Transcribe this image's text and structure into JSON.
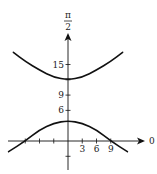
{
  "chart_data": {
    "type": "line",
    "title": "",
    "x_axis_label": "0",
    "y_axis_label_numerator": "π",
    "y_axis_label_denominator": "2",
    "x_ticks": [
      -9,
      -6,
      -3,
      3,
      6,
      9
    ],
    "x_tick_labels": [
      {
        "value": 3,
        "label": "3"
      },
      {
        "value": 6,
        "label": "6"
      },
      {
        "value": 9,
        "label": "9"
      }
    ],
    "y_ticks": [
      -3,
      6,
      9,
      12,
      15
    ],
    "y_tick_labels": [
      {
        "value": 6,
        "label": "6"
      },
      {
        "value": 9,
        "label": "9"
      },
      {
        "value": 15,
        "label": "15"
      }
    ],
    "xlim": [
      -13,
      14
    ],
    "ylim": [
      -6.5,
      25
    ],
    "series": [
      {
        "name": "upper-branch",
        "vertex": [
          0,
          12
        ],
        "points": [
          [
            -11.5,
            17.4
          ],
          [
            -9,
            15.6
          ],
          [
            -6,
            13.9
          ],
          [
            -3,
            12.5
          ],
          [
            0,
            12
          ],
          [
            3,
            12.5
          ],
          [
            6,
            13.9
          ],
          [
            9,
            15.6
          ],
          [
            11.5,
            17.4
          ]
        ]
      },
      {
        "name": "lower-branch",
        "vertex": [
          0,
          4
        ],
        "points": [
          [
            -12.5,
            -2.1
          ],
          [
            -9,
            0
          ],
          [
            -6,
            2.2
          ],
          [
            -3,
            3.5
          ],
          [
            0,
            4
          ],
          [
            3,
            3.5
          ],
          [
            6,
            2.2
          ],
          [
            9,
            0
          ],
          [
            12.5,
            -2.1
          ]
        ]
      }
    ],
    "grid": false,
    "legend": "none"
  }
}
